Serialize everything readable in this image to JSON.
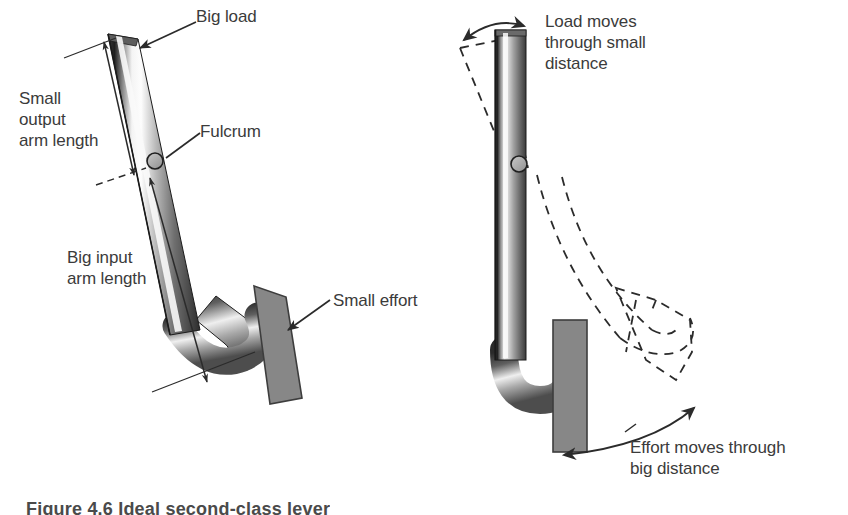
{
  "figure": {
    "caption": "Figure 4.6 Ideal second-class lever",
    "background_color": "#ffffff",
    "text_color": "#3b3b3b",
    "line_color": "#2b2b2b",
    "block_fill_color": "#878787",
    "block_stroke_color": "#3d3d3d",
    "bar_dark_color": "#2f2f2f",
    "bar_light_color": "#f2f2f2",
    "bar_mid_color": "#9a9a9a"
  },
  "panels": [
    {
      "id": "left-panel",
      "name": "static-lever-panel",
      "description": "Bent lever bar at rest with labelled fulcrum, load, effort and arm lengths"
    },
    {
      "id": "right-panel",
      "name": "motion-lever-panel",
      "description": "Same lever drawn upright with dashed ghost outlines showing swept motion"
    }
  ],
  "labels": {
    "big_load": "Big load",
    "small_output_arm_length": "Small\noutput\narm length",
    "fulcrum": "Fulcrum",
    "big_input_arm_length": "Big input\narm length",
    "small_effort": "Small effort",
    "load_moves": "Load moves\nthrough small\ndistance",
    "effort_moves": "Effort moves through\nbig distance"
  },
  "annotations": {
    "load_arrow": "straight arrow pointing down-left to the load end of the bar",
    "fulcrum_arrow": "straight leader line pointing to the pivot circle",
    "effort_arrow": "straight arrow pointing left to the effort block",
    "output_arm_measure": "double-headed measurement arrow spanning the short output arm",
    "input_arm_measure": "double-headed measurement arrow spanning the long input arm",
    "load_swing_arc": "double-headed curved arrow showing small load travel",
    "effort_swing_arc": "double-headed curved arrow showing large effort travel"
  }
}
